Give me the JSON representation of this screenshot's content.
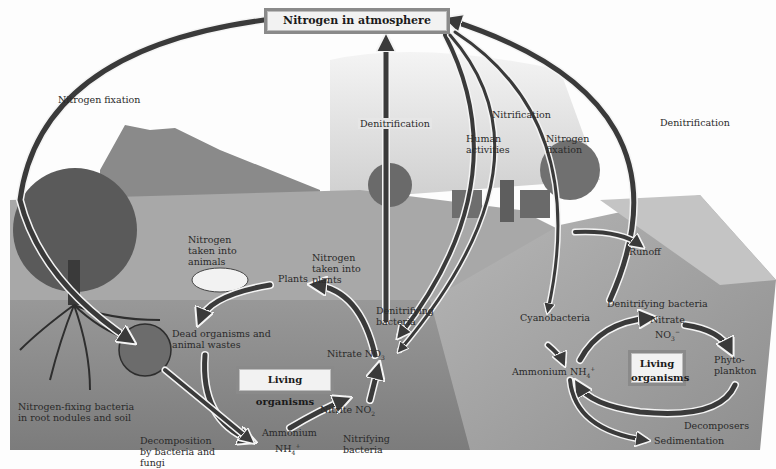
{
  "diagram": {
    "title": "Nitrogen in atmosphere",
    "colors": {
      "arrow_dark": "#3a3a3a",
      "arrow_outline": "#f4f4f4",
      "box_fill": "#f2f2f2",
      "box_border": "#8a8a8a",
      "soil": "#8c8c8c",
      "water": "#a6a6a6",
      "sky": "#dcdcdc"
    },
    "atmosphere_arrows": {
      "nitrogen_fixation_left": "Nitrogen fixation",
      "denitrification_center": "Denitrification",
      "human_activities": "Human activities",
      "nitrification": "Nitrification",
      "nitrogen_fixation_right": "Nitrogen fixation",
      "denitrification_right": "Denitrification"
    },
    "land": {
      "nitrogen_taken_into_animals": "Nitrogen taken into animals",
      "nitrogen_taken_into_plants": "Nitrogen taken into plants",
      "plants": "Plants",
      "dead_organisms": "Dead organisms and animal wastes",
      "denitrifying_bacteria": "Denitrifying bacteria",
      "nitrate_label": "Nitrate NO",
      "nitrate_sub": "3",
      "living_organisms": "Living organisms",
      "nitrogen_fixing_bacteria": "Nitrogen-fixing bacteria in root nodules and soil",
      "decomposition": "Decomposition by bacteria and fungi",
      "ammonium_label": "Ammonium",
      "ammonium_formula": "NH",
      "ammonium_sub": "4",
      "ammonium_sup": "+",
      "nitrite_label": "Nitrite NO",
      "nitrite_sub": "2",
      "nitrifying_bacteria": "Nitrifying bacteria"
    },
    "water": {
      "runoff": "Runoff",
      "cyanobacteria": "Cyanobacteria",
      "denitrifying_bacteria": "Denitrifying bacteria",
      "nitrate_label": "Nitrate",
      "nitrate_formula": "NO",
      "nitrate_sub": "3",
      "nitrate_sup": "−",
      "ammonium_label": "Ammonium NH",
      "ammonium_sub": "4",
      "ammonium_sup": "+",
      "living_organisms_line1": "Living",
      "living_organisms_line2": "organisms",
      "phytoplankton": "Phyto- plankton",
      "decomposers": "Decomposers",
      "sedimentation": "Sedimentation"
    }
  }
}
